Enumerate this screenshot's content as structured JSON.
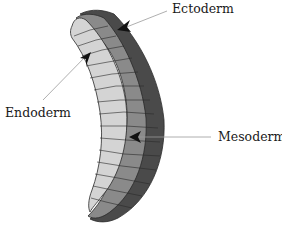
{
  "figure": {
    "labels": {
      "ectoderm": "Ectoderm",
      "endoderm": "Endoderm",
      "mesoderm": "Mesoderm"
    },
    "colors": {
      "ectoderm": "#4a4a4a",
      "mesoderm": "#8a8a8a",
      "endoderm": "#d4d4d4",
      "outline": "#2a2a2a",
      "leader_line": "#9a9a9a",
      "arrowhead": "#111111"
    }
  }
}
